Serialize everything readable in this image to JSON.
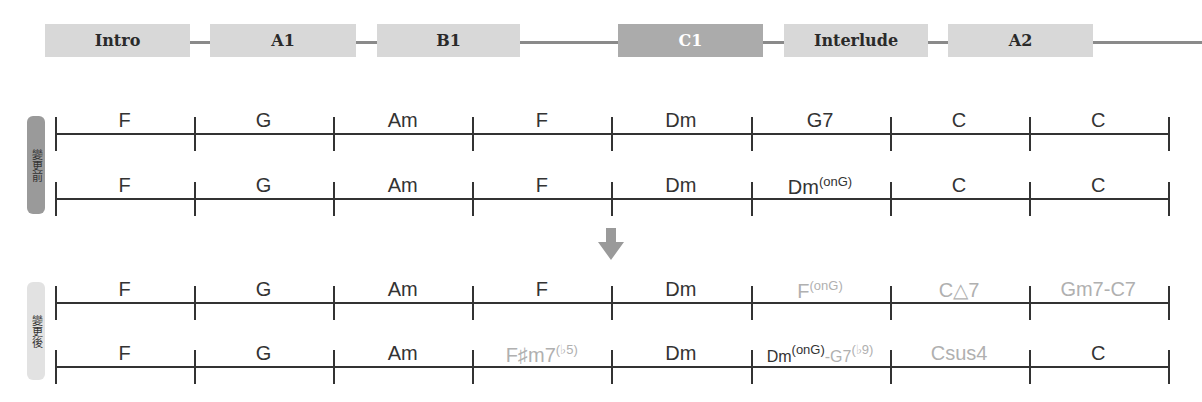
{
  "sections": [
    {
      "label": "Intro",
      "active": false
    },
    {
      "label": "A1",
      "active": false
    },
    {
      "label": "B1",
      "active": false
    },
    {
      "label": "C1",
      "active": true
    },
    {
      "label": "Interlude",
      "active": false
    },
    {
      "label": "A2",
      "active": false
    }
  ],
  "labels": {
    "before": "變更前",
    "after": "變更後"
  },
  "rows": {
    "before_1": [
      {
        "root": "F"
      },
      {
        "root": "G"
      },
      {
        "root": "Am"
      },
      {
        "root": "F"
      },
      {
        "root": "Dm"
      },
      {
        "root": "G7"
      },
      {
        "root": "C"
      },
      {
        "root": "C"
      }
    ],
    "before_2": [
      {
        "root": "F"
      },
      {
        "root": "G"
      },
      {
        "root": "Am"
      },
      {
        "root": "F"
      },
      {
        "root": "Dm"
      },
      {
        "root": "Dm",
        "sup": "(onG)"
      },
      {
        "root": "C"
      },
      {
        "root": "C"
      }
    ],
    "after_1": [
      {
        "root": "F"
      },
      {
        "root": "G"
      },
      {
        "root": "Am"
      },
      {
        "root": "F"
      },
      {
        "root": "Dm"
      },
      {
        "root": "F",
        "sup": "(onG)",
        "changed": true
      },
      {
        "root": "C△7",
        "changed": true
      },
      {
        "root": "Gm7-C7",
        "changed": true
      }
    ],
    "after_2": [
      {
        "root": "F"
      },
      {
        "root": "G"
      },
      {
        "root": "Am"
      },
      {
        "root": "F♯m7",
        "sup": "(♭5)",
        "changed": true
      },
      {
        "root": "Dm"
      },
      {
        "root": "Dm",
        "sup": "(onG)",
        "tail": "-G7",
        "tail_sup": "(♭9)",
        "tail_changed": true
      },
      {
        "root": "Csus4",
        "changed": true
      },
      {
        "root": "C"
      }
    ]
  },
  "colors": {
    "section_box": "#d8d8d8",
    "section_active": "#ababab",
    "changed_chord": "#b0b0b0",
    "line": "#333333",
    "arrow": "#9a9a9a"
  }
}
